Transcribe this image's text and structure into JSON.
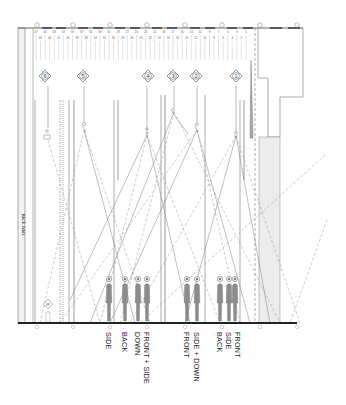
{
  "drawing": {
    "type": "lighting section / pole rig plan",
    "wall_label": "BACK WALL",
    "grid_markers_top": [
      "⑪",
      "⑩",
      "⑨",
      "⑧",
      "⑦",
      "⑥",
      "⑤",
      "④"
    ],
    "pipe_numbers_row1": [
      "47",
      "45",
      "43",
      "41",
      "39",
      "37",
      "35",
      "33",
      "31",
      "29",
      "27",
      "25",
      "23",
      "21",
      "19",
      "17",
      "15",
      "13",
      "11",
      "9",
      "7",
      "5",
      "3",
      "1"
    ],
    "pipe_numbers_row2": [
      "46",
      "44",
      "42",
      "40",
      "38",
      "36",
      "34",
      "32",
      "30",
      "28",
      "26",
      "24",
      "22",
      "20",
      "18",
      "16",
      "14",
      "12",
      "10",
      "8",
      "6",
      "4",
      "2"
    ],
    "position_tags": [
      {
        "id": "6",
        "label": "6"
      },
      {
        "id": "5",
        "label": "5"
      },
      {
        "id": "4",
        "label": "4"
      },
      {
        "id": "3",
        "label": "3"
      },
      {
        "id": "2",
        "label": "2"
      },
      {
        "id": "1",
        "label": "1"
      }
    ],
    "small_tag": "SP",
    "figure_groups": [
      {
        "group": "A",
        "labels": [
          "SIDE",
          "BACK",
          "DOWN",
          "FRONT + SIDE"
        ]
      },
      {
        "group": "B",
        "labels": [
          "FRONT",
          "SIDE + DOWN"
        ]
      },
      {
        "group": "C",
        "labels": [
          "BACK",
          "SIDE",
          "FRONT"
        ]
      }
    ],
    "figure_labels": {
      "l1": "SIDE",
      "l2": "BACK",
      "l3": "DOWN",
      "l4": "FRONT + SIDE",
      "l5": "FRONT",
      "l6": "SIDE + DOWN",
      "l7": "BACK",
      "l8": "SIDE",
      "l9": "FRONT"
    },
    "colors": {
      "line": "#6a6a6a",
      "light_line": "#9a9a9a",
      "figure": "#8c8c8c",
      "floor": "#222222",
      "apron_fill": "#ececec",
      "wall_fill": "#f1f1f1"
    }
  }
}
